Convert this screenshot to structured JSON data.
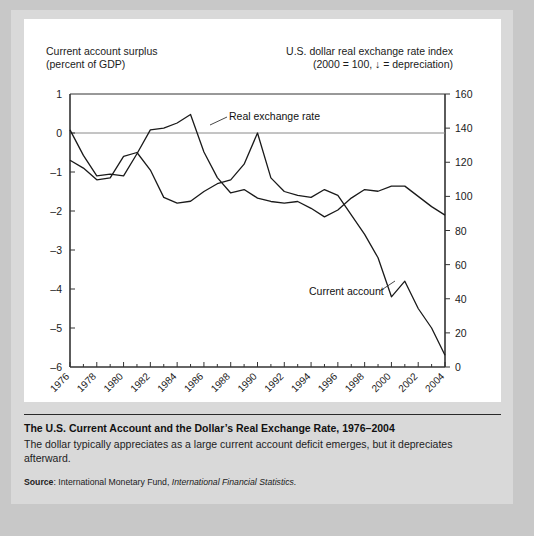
{
  "figure": {
    "left_axis_title": "Current account surplus\n(percent of GDP)",
    "right_axis_title": "U.S. dollar real exchange rate index\n(2000  = 100, ↓ = depreciation)",
    "caption_title": "The U.S. Current Account and the Dollar’s Real Exchange Rate, 1976–2004",
    "caption_body": "The dollar typically appreciates as a large current account deficit emerges, but it depreciates afterward.",
    "source_label": "Source",
    "source_colon": ": ",
    "source_org": "International Monetary Fund, ",
    "source_pub": "International Financial Statistics."
  },
  "chart_data": {
    "type": "line",
    "title": "The U.S. Current Account and the Dollar’s Real Exchange Rate, 1976–2004",
    "xlabel": "",
    "ylabel": "Current account surplus (percent of GDP)",
    "y2label": "U.S. dollar real exchange rate index (2000 = 100)",
    "grid": false,
    "gridlines": [
      0
    ],
    "legend_position": "inline-annotations",
    "x": [
      1976,
      1977,
      1978,
      1979,
      1980,
      1981,
      1982,
      1983,
      1984,
      1985,
      1986,
      1987,
      1988,
      1989,
      1990,
      1991,
      1992,
      1993,
      1994,
      1995,
      1996,
      1997,
      1998,
      1999,
      2000,
      2001,
      2002,
      2003,
      2004
    ],
    "xticks": [
      1976,
      1978,
      1980,
      1982,
      1984,
      1986,
      1988,
      1990,
      1992,
      1994,
      1996,
      1998,
      2000,
      2002,
      2004
    ],
    "xtick_labels": [
      "1976",
      "1978",
      "1980",
      "1982",
      "1984",
      "1986",
      "1988",
      "1990",
      "1992",
      "1994",
      "1996",
      "1998",
      "2000",
      "2002",
      "2004"
    ],
    "yticks": [
      1,
      0,
      -1,
      -2,
      -3,
      -4,
      -5,
      -6
    ],
    "ytick_labels": [
      "1",
      "0",
      "–1",
      "–2",
      "–3",
      "–4",
      "–5",
      "–6"
    ],
    "ylim": [
      -6,
      1
    ],
    "y2ticks": [
      0,
      20,
      40,
      60,
      80,
      100,
      120,
      140,
      160
    ],
    "y2tick_labels": [
      "0",
      "20",
      "40",
      "60",
      "80",
      "100",
      "120",
      "140",
      "160"
    ],
    "y2lim": [
      0,
      160
    ],
    "series": [
      {
        "name": "Current account",
        "axis": "left",
        "annotation": "Current account",
        "values": [
          -0.7,
          -0.9,
          -1.2,
          -1.15,
          -0.6,
          -0.5,
          -0.95,
          -1.65,
          -1.8,
          -1.75,
          -1.5,
          -1.3,
          -1.2,
          -0.8,
          0.0,
          -1.15,
          -1.5,
          -1.6,
          -1.65,
          -1.45,
          -1.6,
          -2.1,
          -2.6,
          -3.2,
          -4.2,
          -3.8,
          -4.5,
          -5.0,
          -5.7
        ]
      },
      {
        "name": "Real exchange rate",
        "axis": "right",
        "annotation": "Real exchange rate",
        "values": [
          139.0,
          124.0,
          112.0,
          113.0,
          112.0,
          125.0,
          139.0,
          140.0,
          143.0,
          148.0,
          126.0,
          111.0,
          102.0,
          104.0,
          99.0,
          97.0,
          96.0,
          97.0,
          93.0,
          88.0,
          92.0,
          99.0,
          104.0,
          103.0,
          106.0,
          106.0,
          100.0,
          94.0,
          89.0
        ]
      }
    ]
  }
}
